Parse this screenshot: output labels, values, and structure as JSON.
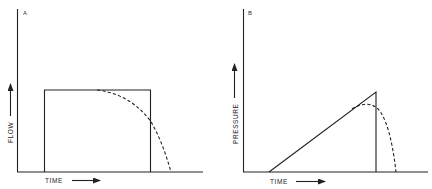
{
  "panels": [
    {
      "id": "A",
      "label": "A",
      "y_axis_label": "FLOW",
      "x_axis_label": "TIME",
      "solid_shape": "rectangle",
      "dashed_shape": "decaying curve after plateau"
    },
    {
      "id": "B",
      "label": "B",
      "y_axis_label": "PRESSURE",
      "x_axis_label": "TIME",
      "solid_shape": "triangle (linear ramp then vertical drop)",
      "dashed_shape": "rounded peak then decay"
    }
  ],
  "colors": {
    "ink": "#222222",
    "background": "#ffffff"
  }
}
